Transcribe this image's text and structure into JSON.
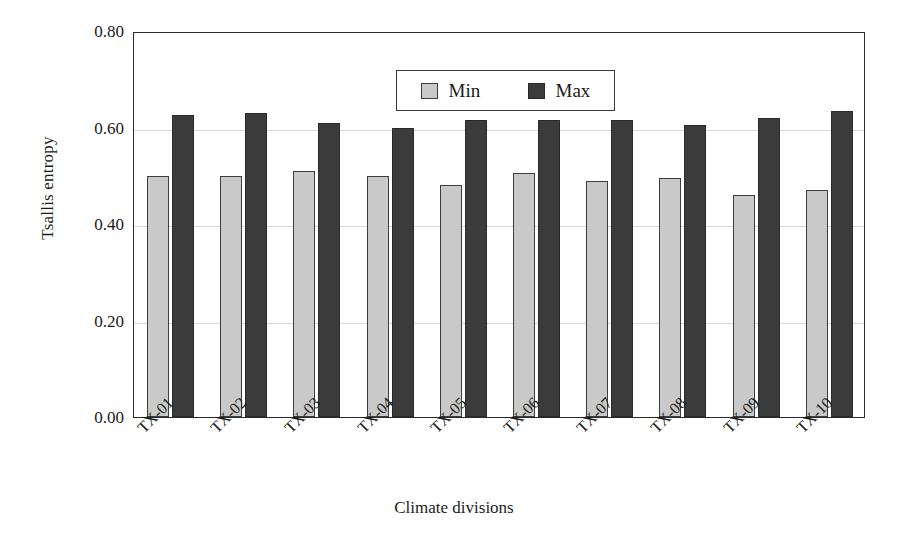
{
  "chart_data": {
    "type": "bar",
    "title": "",
    "xlabel": "Climate divisions",
    "ylabel": "Tsallis entropy",
    "categories": [
      "TX-01",
      "TX-02",
      "TX-03",
      "TX-04",
      "TX-05",
      "TX-06",
      "TX-07",
      "TX-08",
      "TX-09",
      "TX-10"
    ],
    "series": [
      {
        "name": "Min",
        "color": "#c9c9c9",
        "values": [
          0.5,
          0.5,
          0.51,
          0.5,
          0.48,
          0.505,
          0.49,
          0.495,
          0.46,
          0.47
        ]
      },
      {
        "name": "Max",
        "color": "#3b3b3b",
        "values": [
          0.625,
          0.63,
          0.61,
          0.6,
          0.615,
          0.615,
          0.615,
          0.605,
          0.62,
          0.635
        ]
      }
    ],
    "ylim": [
      0.0,
      0.8
    ],
    "ytick_labels": [
      "0.80",
      "0.60",
      "0.40",
      "0.20",
      "0.00"
    ],
    "ytick_values": [
      0.8,
      0.6,
      0.4,
      0.2,
      0.0
    ],
    "grid": "horizontal",
    "legend_position": "inside-top-center",
    "xtick_rotation": -45
  },
  "axes": {
    "y_title": "Tsallis entropy",
    "x_title": "Climate divisions"
  },
  "legend": {
    "entries": [
      {
        "label": "Min",
        "swatch": "min-swatch"
      },
      {
        "label": "Max",
        "swatch": "max-swatch"
      }
    ]
  }
}
